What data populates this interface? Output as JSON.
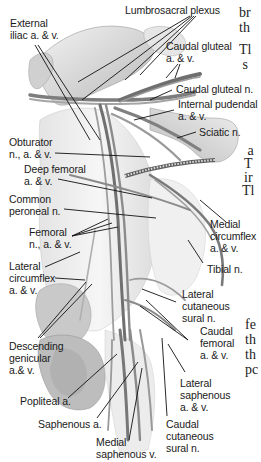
{
  "figure": {
    "labels": {
      "lumbosacral_plexus": "Lumbrosacral plexus",
      "external_iliac": "External\niliac a. & v.",
      "caudal_gluteal_av": "Caudal gluteal\na. & v.",
      "caudal_gluteal_n": "Caudal gluteal n.",
      "internal_pudendal": "Internal pudendal\na. & v.",
      "sciatic_n": "Sciatic n.",
      "obturator": "Obturator\nn., a. & v.",
      "deep_femoral": "Deep femoral\na. & v.",
      "common_peroneal": "Common\nperoneal n.",
      "femoral": "Femoral\nn., a. & v.",
      "medial_circumflex": "Medial\ncircumflex\na. & v.",
      "tibial_n": "Tibial n.",
      "lateral_circumflex": "Lateral\ncircumflex\na. & v.",
      "lateral_cutaneous_sural": "Lateral\ncutaneous\nsural n.",
      "descending_genicular": "Descending\ngenicular\na.& v.",
      "caudal_femoral": "Caudal\nfemoral\na. & v.",
      "popliteal_a": "Popliteal a.",
      "lateral_saphenous": "Lateral\nsaphenous\na. & v.",
      "saphenous_a": "Saphenous a.",
      "caudal_cutaneous_sural": "Caudal\ncutaneous\nsural n.",
      "medial_saphenous_v": "Medial\nsaphenous v."
    },
    "cropped_body_text": [
      {
        "text": "br",
        "top": 5
      },
      {
        "text": "th",
        "top": 20
      },
      {
        "text": "Tl",
        "top": 42
      },
      {
        "text": " s",
        "top": 57
      },
      {
        "text": " a",
        "top": 143
      },
      {
        "text": "T",
        "top": 156
      },
      {
        "text": "ir",
        "top": 170
      },
      {
        "text": "Tl",
        "top": 183
      },
      {
        "text": "fe",
        "top": 317
      },
      {
        "text": "th",
        "top": 332
      },
      {
        "text": "th",
        "top": 347
      },
      {
        "text": "pc",
        "top": 362
      }
    ]
  }
}
